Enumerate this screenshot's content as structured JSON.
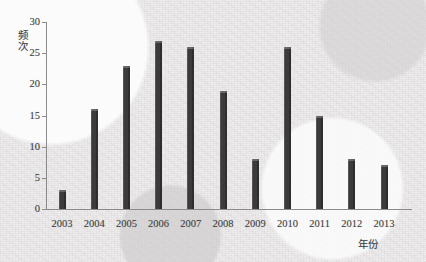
{
  "chart_data": {
    "type": "bar",
    "title": "",
    "xlabel": "年份",
    "ylabel": "频次",
    "categories": [
      "2003",
      "2004",
      "2005",
      "2006",
      "2007",
      "2008",
      "2009",
      "2010",
      "2011",
      "2012",
      "2013"
    ],
    "values": [
      3,
      16,
      23,
      27,
      26,
      19,
      8,
      26,
      15,
      8,
      7
    ],
    "yticks": [
      "0",
      "5",
      "10",
      "15",
      "20",
      "25",
      "30"
    ],
    "ytick_values": [
      0,
      5,
      10,
      15,
      20,
      25,
      30
    ],
    "ylim": [
      0,
      30
    ],
    "grid": false,
    "legend": null,
    "bar_color": "#3b3b3b",
    "axis_color": "#8b8b8b",
    "background_color": "#eeecec",
    "text_color": "#3c3c3c"
  }
}
